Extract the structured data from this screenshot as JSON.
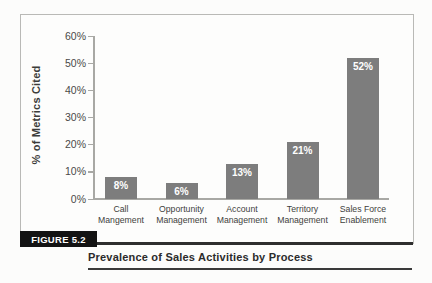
{
  "figure": {
    "label": "FIGURE 5.2",
    "caption": "Prevalence of Sales Activities by Process"
  },
  "chart_data": {
    "type": "bar",
    "title": "",
    "xlabel": "",
    "ylabel": "% of Metrics Cited",
    "categories": [
      [
        "Call",
        "Mangement"
      ],
      [
        "Opportunity",
        "Management"
      ],
      [
        "Account",
        "Management"
      ],
      [
        "Territory",
        "Management"
      ],
      [
        "Sales Force",
        "Enablement"
      ]
    ],
    "values": [
      8,
      6,
      13,
      21,
      52
    ],
    "bar_labels": [
      "8%",
      "6%",
      "13%",
      "21%",
      "52%"
    ],
    "ylim": [
      0,
      60
    ],
    "ytick_step": 10,
    "yticks": [
      "0%",
      "10%",
      "20%",
      "30%",
      "40%",
      "50%",
      "60%"
    ],
    "grid": false,
    "legend": "none",
    "bar_color": "#7d7d7d",
    "bar_label_color": "#ffffff"
  }
}
